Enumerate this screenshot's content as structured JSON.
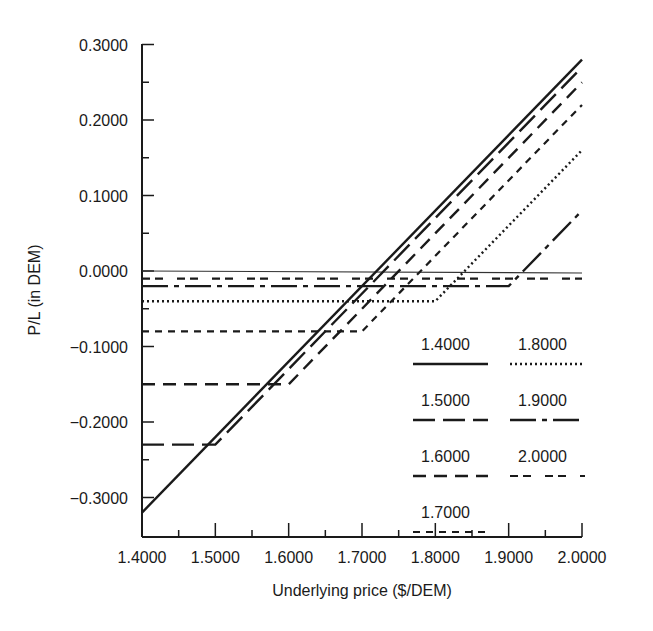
{
  "chart_data": {
    "type": "line",
    "title": "",
    "xlabel": "Underlying price ($/DEM)",
    "ylabel": "P/L (in DEM)",
    "xlim": [
      1.4,
      2.0
    ],
    "ylim": [
      -0.35,
      0.3
    ],
    "x_ticks": [
      "1.4000",
      "1.5000",
      "1.6000",
      "1.7000",
      "1.8000",
      "1.9000",
      "2.0000"
    ],
    "y_ticks": [
      "0.3000",
      "0.2000",
      "0.1000",
      "0.0000",
      "−0.1000",
      "−0.2000",
      "−0.3000"
    ],
    "grid": false,
    "legend_position": "lower right inside",
    "zero_line": true,
    "series": [
      {
        "name": "1.4000",
        "style": "solid",
        "strike": 1.4,
        "premium": 0.32,
        "points": [
          [
            1.4,
            -0.32
          ],
          [
            2.0,
            0.28
          ]
        ]
      },
      {
        "name": "1.5000",
        "style": "long-dash",
        "strike": 1.5,
        "premium": 0.23,
        "points": [
          [
            1.4,
            -0.23
          ],
          [
            1.5,
            -0.23
          ],
          [
            2.0,
            0.27
          ]
        ]
      },
      {
        "name": "1.6000",
        "style": "dash",
        "strike": 1.6,
        "premium": 0.15,
        "points": [
          [
            1.4,
            -0.15
          ],
          [
            1.6,
            -0.15
          ],
          [
            2.0,
            0.25
          ]
        ]
      },
      {
        "name": "1.7000",
        "style": "short-dash",
        "strike": 1.7,
        "premium": 0.08,
        "points": [
          [
            1.4,
            -0.08
          ],
          [
            1.7,
            -0.08
          ],
          [
            2.0,
            0.22
          ]
        ]
      },
      {
        "name": "1.8000",
        "style": "dotted",
        "strike": 1.8,
        "premium": 0.04,
        "points": [
          [
            1.4,
            -0.04
          ],
          [
            1.8,
            -0.04
          ],
          [
            2.0,
            0.16
          ]
        ]
      },
      {
        "name": "1.9000",
        "style": "dash-dot",
        "strike": 1.9,
        "premium": 0.02,
        "points": [
          [
            1.4,
            -0.02
          ],
          [
            1.9,
            -0.02
          ],
          [
            2.0,
            0.08
          ]
        ]
      },
      {
        "name": "2.0000",
        "style": "dash-pair",
        "strike": 2.0,
        "premium": 0.01,
        "points": [
          [
            1.4,
            -0.01
          ],
          [
            2.0,
            -0.01
          ]
        ]
      }
    ]
  }
}
